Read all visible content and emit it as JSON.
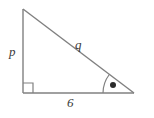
{
  "figure": {
    "kind": "right-triangle-diagram",
    "background_color": "#ffffff",
    "stroke_color": "#808080",
    "text_color": "#3b3b3b",
    "labels": {
      "vertical_leg": "p",
      "hypotenuse": "q",
      "base": "6"
    },
    "markers": {
      "right_angle": "right-angle-square",
      "marked_angle": "angle-arc-with-dot"
    },
    "geometry": {
      "apex": [
        23,
        9
      ],
      "right_angle_vertex": [
        23,
        93
      ],
      "base_right_vertex": [
        134,
        93
      ],
      "right_angle_square_size": 10,
      "angle_arc_radius": 31,
      "angle_dot_center": [
        113,
        85
      ],
      "angle_dot_radius": 3
    }
  }
}
